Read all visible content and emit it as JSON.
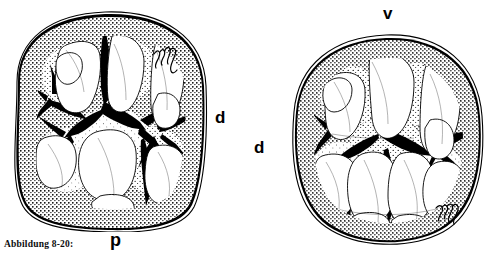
{
  "figure": {
    "caption": "Abbildung 8-20:",
    "background_color": "#ffffff",
    "ink_color": "#000000",
    "width_px": 500,
    "height_px": 259
  },
  "left_tooth": {
    "name": "left-molar-occlusal-view",
    "labels": {
      "distal": "d",
      "posterior": "p"
    },
    "signature_mark": "artist-initials"
  },
  "right_tooth": {
    "name": "right-molar-occlusal-view",
    "labels": {
      "vestibular": "v",
      "distal": "d"
    },
    "signature_mark": "artist-initials"
  }
}
